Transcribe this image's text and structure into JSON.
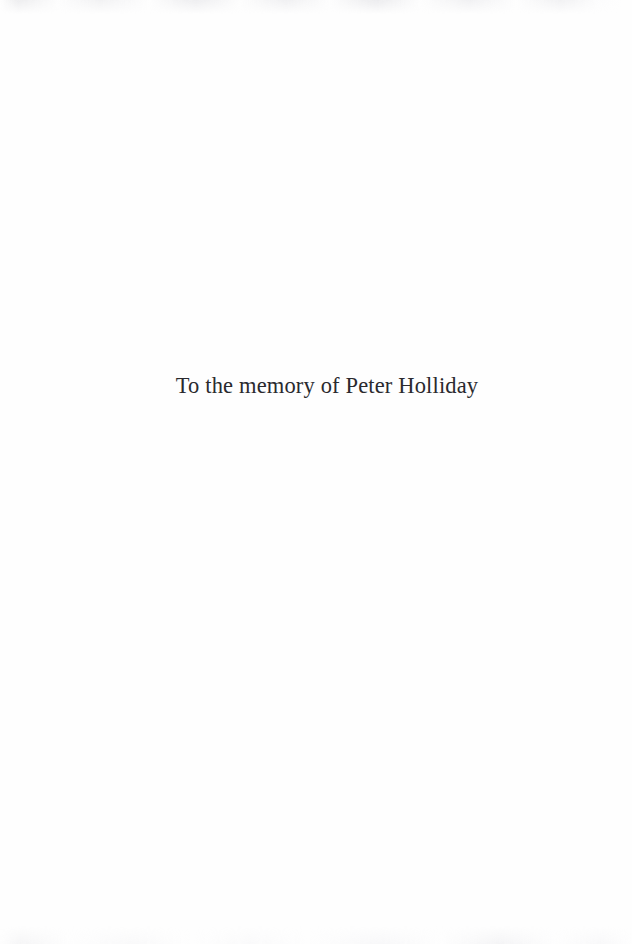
{
  "page": {
    "kind": "book-dedication-page",
    "paper_color": "#fefefe",
    "ink_color": "#2a2a2e"
  },
  "dedication": {
    "full_text": "To the memory of Peter Holliday",
    "lead_in": "To the memory of",
    "honoree": "Peter Holliday"
  }
}
